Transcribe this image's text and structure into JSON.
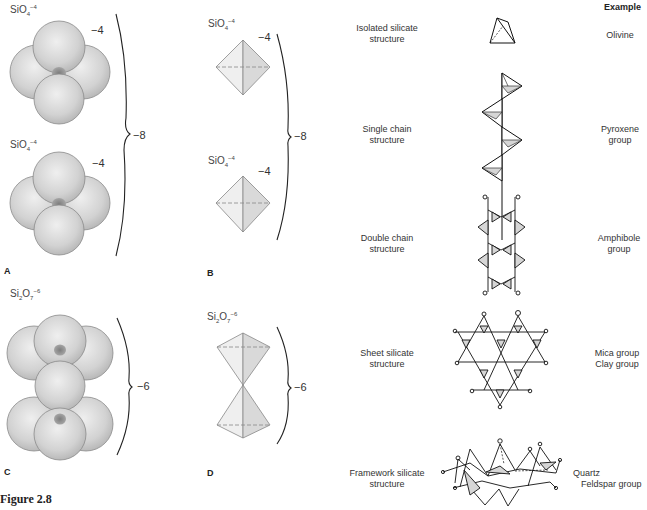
{
  "figure": {
    "caption": "Figure 2.8",
    "panels": {
      "A": {
        "letter": "A",
        "units": [
          {
            "formula_base": "SiO",
            "formula_sub": "4",
            "formula_sup": "−4",
            "charge": "−4"
          },
          {
            "formula_base": "SiO",
            "formula_sub": "4",
            "formula_sup": "−4",
            "charge": "−4"
          }
        ],
        "total_charge": "−8"
      },
      "B": {
        "letter": "B",
        "units": [
          {
            "formula_base": "SiO",
            "formula_sub": "4",
            "formula_sup": "−4",
            "charge": "−4"
          },
          {
            "formula_base": "SiO",
            "formula_sub": "4",
            "formula_sup": "−4",
            "charge": "−4"
          }
        ],
        "total_charge": "−8"
      },
      "C": {
        "letter": "C",
        "formula_si": "Si",
        "formula_si_sub": "2",
        "formula_o": "O",
        "formula_o_sub": "7",
        "formula_sup": "−6",
        "total_charge": "−6"
      },
      "D": {
        "letter": "D",
        "formula_si": "Si",
        "formula_si_sub": "2",
        "formula_o": "O",
        "formula_o_sub": "7",
        "formula_sup": "−6",
        "total_charge": "−6"
      }
    },
    "structures": {
      "example_header": "Example",
      "rows": [
        {
          "structure_line1": "Isolated silicate",
          "structure_line2": "structure",
          "example_line1": "Olivine",
          "example_line2": ""
        },
        {
          "structure_line1": "Single chain",
          "structure_line2": "structure",
          "example_line1": "Pyroxene",
          "example_line2": "group"
        },
        {
          "structure_line1": "Double chain",
          "structure_line2": "structure",
          "example_line1": "Amphibole",
          "example_line2": "group"
        },
        {
          "structure_line1": "Sheet silicate",
          "structure_line2": "structure",
          "example_line1": "Mica group",
          "example_line2": "Clay group"
        },
        {
          "structure_line1": "Framework silicate",
          "structure_line2": "structure",
          "example_line1": "Quartz",
          "example_line2": "Feldspar group"
        }
      ]
    },
    "icons": [
      "sphere-packing-tetrahedron",
      "tetrahedron-icon",
      "curly-brace",
      "silicate-chain",
      "silicate-sheet",
      "silicate-framework"
    ],
    "colors": {
      "sphere_fill": "#d4d4d4",
      "sphere_stroke": "#8a8a8a",
      "silicon_core": "#8f8f8f",
      "tetra_light": "#ececec",
      "tetra_dark": "#d8d8d8",
      "line": "#111111"
    }
  }
}
